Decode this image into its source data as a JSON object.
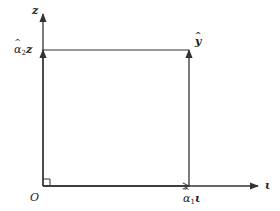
{
  "diagram": {
    "type": "vector-decomposition",
    "colors": {
      "line": "#333333",
      "text": "#222222",
      "background": "#ffffff"
    },
    "axes": {
      "vertical": {
        "label": "z"
      },
      "horizontal": {
        "label": "ι"
      }
    },
    "origin": {
      "label": "O"
    },
    "labels": {
      "alpha2z": {
        "symbol": "α",
        "subscript": "2",
        "vector": "z"
      },
      "alpha1iota": {
        "symbol": "α",
        "subscript": "1",
        "vector": "ι"
      },
      "y_hat": "y"
    },
    "right_angle_marker": true
  }
}
